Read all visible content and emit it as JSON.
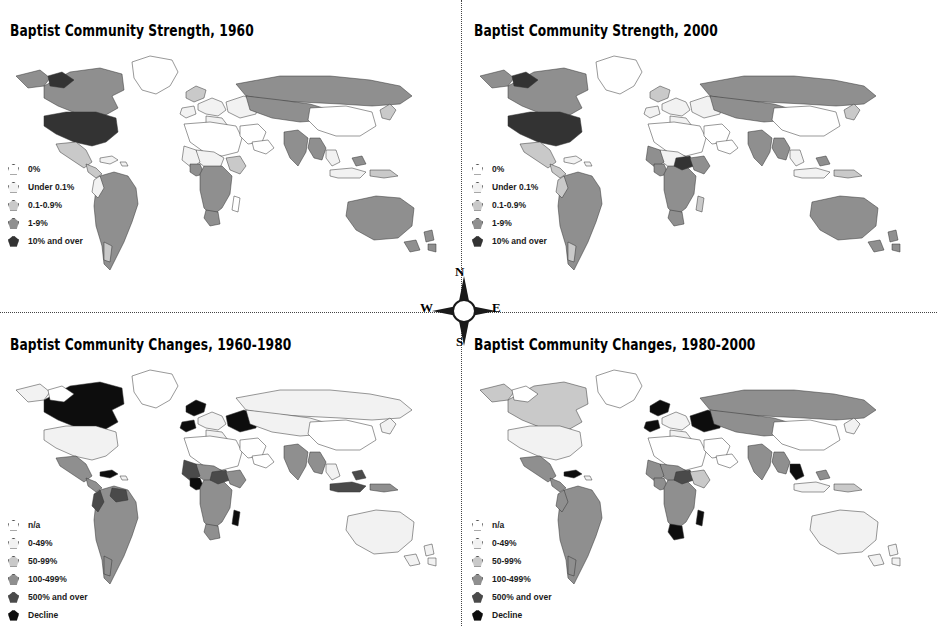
{
  "figure": {
    "layout": "2x2 world choropleth map grid",
    "background_color": "#ffffff",
    "divider_style": "dotted"
  },
  "compass": {
    "north": "N",
    "south": "S",
    "west": "W",
    "east": "E"
  },
  "legends": {
    "strength": [
      {
        "label": "0%",
        "color": "#ffffff"
      },
      {
        "label": "Under 0.1%",
        "color": "#f2f2f2"
      },
      {
        "label": "0.1-0.9%",
        "color": "#c9c9c9"
      },
      {
        "label": "1-9%",
        "color": "#8f8f8f"
      },
      {
        "label": "10% and over",
        "color": "#333333"
      }
    ],
    "changes": [
      {
        "label": "n/a",
        "color": "#ffffff"
      },
      {
        "label": "0-49%",
        "color": "#f2f2f2"
      },
      {
        "label": "50-99%",
        "color": "#c9c9c9"
      },
      {
        "label": "100-499%",
        "color": "#8f8f8f"
      },
      {
        "label": "500% and over",
        "color": "#4a4a4a"
      },
      {
        "label": "Decline",
        "color": "#0d0d0d"
      }
    ]
  },
  "panels": [
    {
      "id": "strength-1960",
      "title": "Baptist Community Strength, 1960",
      "legend": "strength",
      "position": "top-left"
    },
    {
      "id": "strength-2000",
      "title": "Baptist Community Strength, 2000",
      "legend": "strength",
      "position": "top-right"
    },
    {
      "id": "changes-1960-1980",
      "title": "Baptist Community Changes, 1960-1980",
      "legend": "changes",
      "position": "bottom-left"
    },
    {
      "id": "changes-1980-2000",
      "title": "Baptist Community Changes, 1980-2000",
      "legend": "changes",
      "position": "bottom-right"
    }
  ],
  "chart_data": {
    "type": "heatmap",
    "subtype": "choropleth world maps",
    "maps": [
      {
        "name": "Baptist Community Strength, 1960",
        "scale": [
          "0%",
          "Under 0.1%",
          "0.1-0.9%",
          "1-9%",
          "10% and over"
        ],
        "regions": [
          {
            "region": "United States",
            "class": "10% and over"
          },
          {
            "region": "Canada",
            "class": "1-9%"
          },
          {
            "region": "Mexico",
            "class": "0.1-0.9%"
          },
          {
            "region": "Brazil",
            "class": "0.1-0.9%"
          },
          {
            "region": "Argentina",
            "class": "0.1-0.9%"
          },
          {
            "region": "Chile",
            "class": "0.1-0.9%"
          },
          {
            "region": "Colombia",
            "class": "Under 0.1%"
          },
          {
            "region": "Russia / USSR",
            "class": "0.1-0.9%"
          },
          {
            "region": "India",
            "class": "0.1-0.9%"
          },
          {
            "region": "Myanmar",
            "class": "1-9%"
          },
          {
            "region": "China",
            "class": "Under 0.1%"
          },
          {
            "region": "Australia",
            "class": "0.1-0.9%"
          },
          {
            "region": "New Zealand",
            "class": "0.1-0.9%"
          },
          {
            "region": "Nigeria",
            "class": "1-9%"
          },
          {
            "region": "Congo (DR)",
            "class": "1-9%"
          },
          {
            "region": "Central Africa",
            "class": "1-9%"
          },
          {
            "region": "North Africa",
            "class": "0%"
          },
          {
            "region": "Middle East",
            "class": "0%"
          },
          {
            "region": "Western Europe",
            "class": "Under 0.1%"
          },
          {
            "region": "United Kingdom",
            "class": "0.1-0.9%"
          },
          {
            "region": "Greenland",
            "class": "0%"
          }
        ]
      },
      {
        "name": "Baptist Community Strength, 2000",
        "scale": [
          "0%",
          "Under 0.1%",
          "0.1-0.9%",
          "1-9%",
          "10% and over"
        ],
        "regions": [
          {
            "region": "United States",
            "class": "10% and over"
          },
          {
            "region": "Canada",
            "class": "1-9%"
          },
          {
            "region": "Mexico",
            "class": "0.1-0.9%"
          },
          {
            "region": "Brazil",
            "class": "1-9%"
          },
          {
            "region": "Argentina",
            "class": "0.1-0.9%"
          },
          {
            "region": "Russia",
            "class": "0.1-0.9%"
          },
          {
            "region": "India",
            "class": "0.1-0.9%"
          },
          {
            "region": "Myanmar",
            "class": "1-9%"
          },
          {
            "region": "Nigeria",
            "class": "1-9%"
          },
          {
            "region": "Congo (DR)",
            "class": "1-9%"
          },
          {
            "region": "Central African Republic",
            "class": "10% and over"
          },
          {
            "region": "Angola",
            "class": "1-9%"
          },
          {
            "region": "Zambia",
            "class": "1-9%"
          },
          {
            "region": "Zimbabwe",
            "class": "1-9%"
          },
          {
            "region": "South Africa",
            "class": "1-9%"
          },
          {
            "region": "Kenya",
            "class": "1-9%"
          },
          {
            "region": "Australia",
            "class": "0.1-0.9%"
          },
          {
            "region": "North Africa",
            "class": "0%"
          },
          {
            "region": "Middle East",
            "class": "0%"
          },
          {
            "region": "Western Europe",
            "class": "Under 0.1%"
          }
        ]
      },
      {
        "name": "Baptist Community Changes, 1960-1980",
        "scale": [
          "n/a",
          "0-49%",
          "50-99%",
          "100-499%",
          "500% and over",
          "Decline"
        ],
        "regions": [
          {
            "region": "Canada",
            "class": "Decline"
          },
          {
            "region": "United States",
            "class": "0-49%"
          },
          {
            "region": "Mexico",
            "class": "100-499%"
          },
          {
            "region": "Brazil",
            "class": "100-499%"
          },
          {
            "region": "Venezuela",
            "class": "500% and over"
          },
          {
            "region": "Colombia",
            "class": "500% and over"
          },
          {
            "region": "Scandinavia",
            "class": "Decline"
          },
          {
            "region": "United Kingdom",
            "class": "Decline"
          },
          {
            "region": "Eastern Europe",
            "class": "0-49%"
          },
          {
            "region": "Russia / USSR",
            "class": "0-49%"
          },
          {
            "region": "India",
            "class": "100-499%"
          },
          {
            "region": "Myanmar",
            "class": "100-499%"
          },
          {
            "region": "Indonesia",
            "class": "500% and over"
          },
          {
            "region": "Australia",
            "class": "0-49%"
          },
          {
            "region": "Nigeria",
            "class": "500% and over"
          },
          {
            "region": "Congo (DR)",
            "class": "100-499%"
          },
          {
            "region": "Madagascar",
            "class": "Decline"
          },
          {
            "region": "Central Africa",
            "class": "500% and over"
          },
          {
            "region": "North Africa",
            "class": "n/a"
          },
          {
            "region": "Middle East",
            "class": "n/a"
          },
          {
            "region": "China",
            "class": "n/a"
          }
        ]
      },
      {
        "name": "Baptist Community Changes, 1980-2000",
        "scale": [
          "n/a",
          "0-49%",
          "50-99%",
          "100-499%",
          "500% and over",
          "Decline"
        ],
        "regions": [
          {
            "region": "Canada",
            "class": "50-99%"
          },
          {
            "region": "United States",
            "class": "0-49%"
          },
          {
            "region": "Mexico",
            "class": "100-499%"
          },
          {
            "region": "Brazil",
            "class": "100-499%"
          },
          {
            "region": "Argentina",
            "class": "100-499%"
          },
          {
            "region": "Cuba",
            "class": "Decline"
          },
          {
            "region": "United Kingdom",
            "class": "Decline"
          },
          {
            "region": "Scandinavia",
            "class": "Decline"
          },
          {
            "region": "Poland",
            "class": "Decline"
          },
          {
            "region": "Russia",
            "class": "100-499%"
          },
          {
            "region": "India",
            "class": "100-499%"
          },
          {
            "region": "Myanmar",
            "class": "100-499%"
          },
          {
            "region": "Malaysia",
            "class": "Decline"
          },
          {
            "region": "Australia",
            "class": "0-49%"
          },
          {
            "region": "Nigeria",
            "class": "100-499%"
          },
          {
            "region": "Sudan",
            "class": "500% and over"
          },
          {
            "region": "Congo (DR)",
            "class": "100-499%"
          },
          {
            "region": "Botswana",
            "class": "Decline"
          },
          {
            "region": "Madagascar",
            "class": "Decline"
          },
          {
            "region": "North Africa",
            "class": "n/a"
          },
          {
            "region": "Middle East",
            "class": "n/a"
          }
        ]
      }
    ]
  }
}
